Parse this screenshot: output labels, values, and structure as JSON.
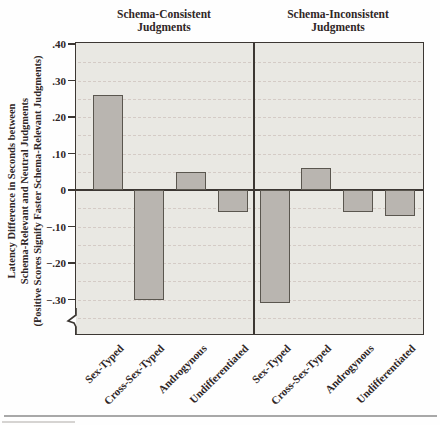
{
  "figure": {
    "y_axis_title_lines": [
      "Latency Difference in Seconds between",
      "Schema-Relevant and Neutral Judgments",
      "(Positive Scores Signify Faster Schema-Relevant Judgments)"
    ],
    "panels": [
      {
        "title_line1": "Schema-Consistent",
        "title_line2": "Judgments"
      },
      {
        "title_line1": "Schema-Inconsistent",
        "title_line2": "Judgments"
      }
    ]
  },
  "chart_data": {
    "type": "bar",
    "categories": [
      "Sex-Typed",
      "Cross-Sex-Typed",
      "Androgynous",
      "Undifferentiated"
    ],
    "series": [
      {
        "name": "Schema-Consistent Judgments",
        "values": [
          0.26,
          -0.3,
          0.05,
          -0.06
        ]
      },
      {
        "name": "Schema-Inconsistent Judgments",
        "values": [
          -0.31,
          0.06,
          -0.06,
          -0.07
        ]
      }
    ],
    "ylabel": "Latency Difference in Seconds between Schema-Relevant and Neutral Judgments (Positive Scores Signify Faster Schema-Relevant Judgments)",
    "ylim": [
      -0.4,
      0.4
    ],
    "ytick_labels": [
      ".40",
      ".30",
      ".20",
      ".10",
      "0",
      "−.10",
      "−.20",
      "−.30"
    ],
    "ytick_values": [
      0.4,
      0.3,
      0.2,
      0.1,
      0,
      -0.1,
      -0.2,
      -0.3
    ],
    "grid": {
      "show": true,
      "style": "dashed",
      "interval": 0.05
    },
    "axis_break": "y-axis broken below −.30",
    "legend_position": "none",
    "colors": {
      "bar_fill": "#b9b5b0",
      "bar_border": "#5a564f",
      "plot_bg": "#e9e8e3",
      "gridline": "#d4cbc6",
      "axis": "#3c3733",
      "text": "#2f2626",
      "bottom_rule": "#a8a8a8",
      "bottom_rule_faint": "#d6d4d2"
    }
  }
}
